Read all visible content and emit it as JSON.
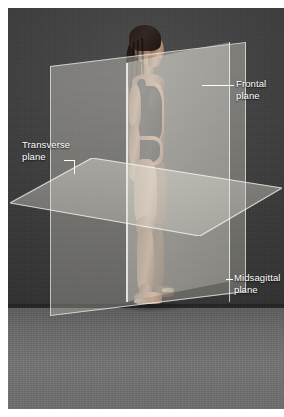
{
  "figure": {
    "subject_description": "Woman standing in anatomical position, lateral view, wearing a dark one-piece swimsuit",
    "background_color": "#3b3b3b",
    "floor_color": "#6f6f6f",
    "plane_color": "#e2e0d6",
    "label_color": "#ffffff",
    "border_color": "#ffffff"
  },
  "labels": {
    "frontal": "Frontal\nplane",
    "transverse": "Transverse\nplane",
    "midsagittal": "Midsagittal\nplane"
  },
  "planes": [
    {
      "name": "frontal",
      "label": "Frontal plane",
      "orientation": "vertical-coronal"
    },
    {
      "name": "transverse",
      "label": "Transverse plane",
      "orientation": "horizontal"
    },
    {
      "name": "midsagittal",
      "label": "Midsagittal plane",
      "orientation": "vertical-sagittal"
    }
  ]
}
